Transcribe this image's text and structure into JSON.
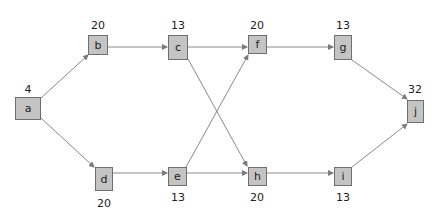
{
  "diagram": {
    "type": "network",
    "nodes": [
      {
        "id": "a",
        "label": "a",
        "value": "4",
        "x": 15,
        "y": 97,
        "w": 26,
        "h": 23,
        "vx": 28,
        "vy": 84,
        "valuePos": "above"
      },
      {
        "id": "b",
        "label": "b",
        "value": "20",
        "x": 88,
        "y": 35,
        "w": 20,
        "h": 20,
        "vx": 98,
        "vy": 20,
        "valuePos": "above"
      },
      {
        "id": "c",
        "label": "c",
        "value": "13",
        "x": 168,
        "y": 35,
        "w": 20,
        "h": 25,
        "vx": 178,
        "vy": 20,
        "valuePos": "above"
      },
      {
        "id": "d",
        "label": "d",
        "value": "20",
        "x": 95,
        "y": 167,
        "w": 18,
        "h": 24,
        "vx": 104,
        "vy": 198,
        "valuePos": "below"
      },
      {
        "id": "e",
        "label": "e",
        "value": "13",
        "x": 168,
        "y": 167,
        "w": 19,
        "h": 19,
        "vx": 178,
        "vy": 192,
        "valuePos": "below"
      },
      {
        "id": "f",
        "label": "f",
        "value": "20",
        "x": 248,
        "y": 35,
        "w": 19,
        "h": 19,
        "vx": 257,
        "vy": 20,
        "valuePos": "above"
      },
      {
        "id": "g",
        "label": "g",
        "value": "13",
        "x": 334,
        "y": 35,
        "w": 18,
        "h": 25,
        "vx": 343,
        "vy": 20,
        "valuePos": "above"
      },
      {
        "id": "h",
        "label": "h",
        "value": "20",
        "x": 248,
        "y": 167,
        "w": 19,
        "h": 19,
        "vx": 257,
        "vy": 192,
        "valuePos": "below"
      },
      {
        "id": "i",
        "label": "i",
        "value": "13",
        "x": 334,
        "y": 167,
        "w": 18,
        "h": 19,
        "vx": 343,
        "vy": 192,
        "valuePos": "below"
      },
      {
        "id": "j",
        "label": "j",
        "value": "32",
        "x": 407,
        "y": 100,
        "w": 17,
        "h": 23,
        "vx": 415,
        "vy": 84,
        "valuePos": "above"
      }
    ],
    "edges": [
      {
        "from": "a",
        "to": "b",
        "x1": 41,
        "y1": 98,
        "x2": 88,
        "y2": 55
      },
      {
        "from": "a",
        "to": "d",
        "x1": 41,
        "y1": 118,
        "x2": 94,
        "y2": 167
      },
      {
        "from": "b",
        "to": "c",
        "x1": 108,
        "y1": 47,
        "x2": 167,
        "y2": 47
      },
      {
        "from": "c",
        "to": "f",
        "x1": 188,
        "y1": 47,
        "x2": 247,
        "y2": 47
      },
      {
        "from": "c",
        "to": "h",
        "x1": 188,
        "y1": 59,
        "x2": 247,
        "y2": 166
      },
      {
        "from": "d",
        "to": "e",
        "x1": 113,
        "y1": 173,
        "x2": 167,
        "y2": 173
      },
      {
        "from": "e",
        "to": "f",
        "x1": 186,
        "y1": 167,
        "x2": 248,
        "y2": 55
      },
      {
        "from": "e",
        "to": "h",
        "x1": 187,
        "y1": 173,
        "x2": 247,
        "y2": 173
      },
      {
        "from": "f",
        "to": "g",
        "x1": 267,
        "y1": 47,
        "x2": 333,
        "y2": 47
      },
      {
        "from": "g",
        "to": "j",
        "x1": 352,
        "y1": 60,
        "x2": 407,
        "y2": 99
      },
      {
        "from": "h",
        "to": "i",
        "x1": 267,
        "y1": 173,
        "x2": 333,
        "y2": 173
      },
      {
        "from": "i",
        "to": "j",
        "x1": 352,
        "y1": 167,
        "x2": 407,
        "y2": 124
      }
    ],
    "colors": {
      "node_fill": "#c4c4c4",
      "node_border": "#6e6e6e",
      "edge": "#8a8a8a",
      "text": "#222222"
    }
  }
}
